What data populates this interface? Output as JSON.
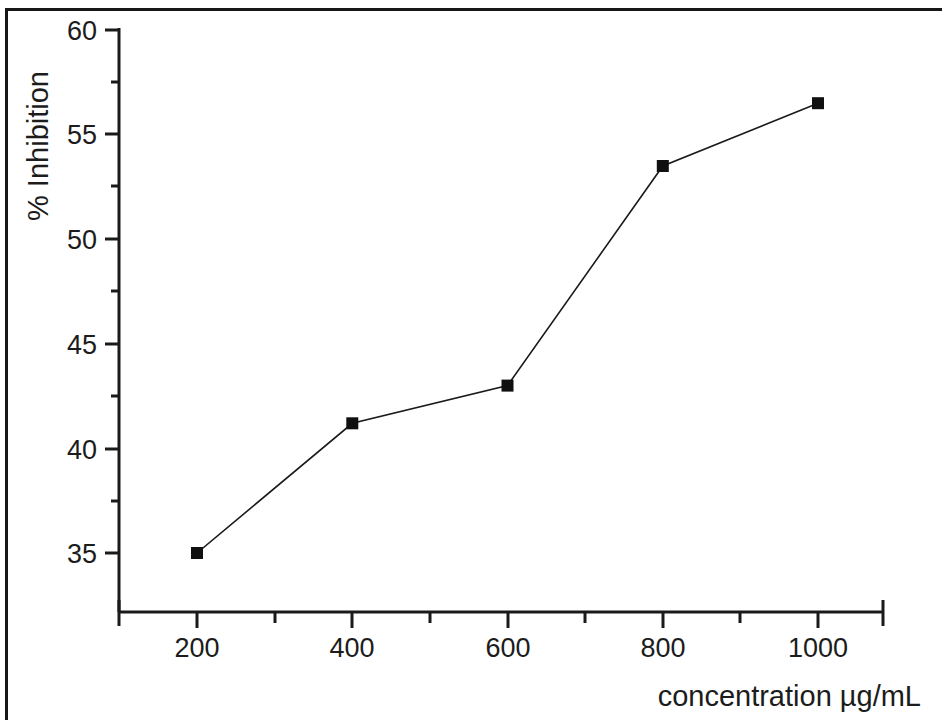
{
  "chart_data": {
    "type": "line",
    "title": "",
    "subtitle": "",
    "xlabel": "concentration µg/mL",
    "ylabel": "% Inhibition",
    "x": [
      200,
      400,
      600,
      800,
      1000
    ],
    "categories": [
      "200",
      "400",
      "600",
      "800",
      "1000"
    ],
    "values": [
      35.0,
      41.2,
      43.0,
      53.5,
      56.5
    ],
    "series": [
      {
        "name": "% Inhibition",
        "values": [
          35.0,
          41.2,
          43.0,
          53.5,
          56.5
        ]
      }
    ],
    "xlim": [
      100,
      1100
    ],
    "ylim": [
      32.8,
      60.0
    ],
    "xticks": [
      200,
      400,
      600,
      800,
      1000
    ],
    "xtick_labels": [
      "200",
      "400",
      "600",
      "800",
      "1000"
    ],
    "xminor_ticks": [
      100,
      300,
      500,
      700,
      900,
      1100
    ],
    "yticks": [
      35,
      40,
      45,
      50,
      55,
      60
    ],
    "ytick_labels": [
      "35",
      "40",
      "45",
      "50",
      "55",
      "60"
    ],
    "yminor_ticks": [
      37.5,
      42.5,
      47.5,
      52.5,
      57.5
    ],
    "grid": false,
    "legend": "none",
    "marker": "filled-square",
    "marker_color": "#101010",
    "line_color": "#1a1a1a",
    "line_width": 1.6,
    "marker_size": 12
  },
  "axes": {
    "y_title": "% Inhibition",
    "x_title": "concentration µg/mL",
    "y_tick_labels": [
      "60",
      "55",
      "50",
      "45",
      "40",
      "35"
    ],
    "x_tick_labels": [
      "200",
      "400",
      "600",
      "800",
      "1000"
    ]
  },
  "colors": {
    "ink": "#1a1a1a",
    "background": "#ffffff",
    "marker": "#101010"
  }
}
